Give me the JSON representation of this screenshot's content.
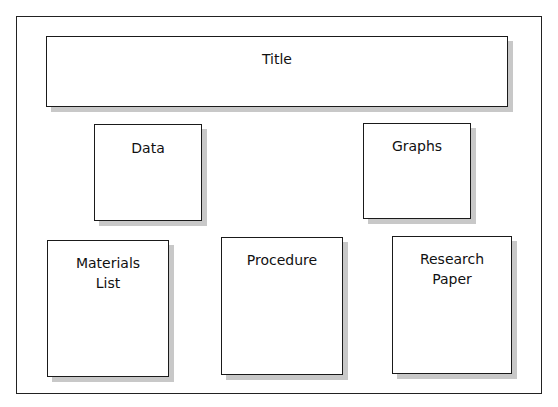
{
  "diagram": {
    "boxes": {
      "title": {
        "label": "Title"
      },
      "data": {
        "label": "Data"
      },
      "graphs": {
        "label": "Graphs"
      },
      "materials": {
        "line1": "Materials",
        "line2": "List"
      },
      "procedure": {
        "label": "Procedure"
      },
      "research": {
        "line1": "Research",
        "line2": "Paper"
      }
    }
  }
}
